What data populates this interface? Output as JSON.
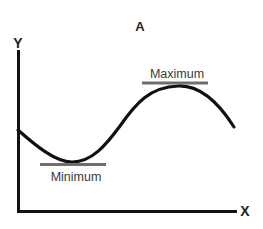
{
  "diagram": {
    "title": "A",
    "axes": {
      "y_label": "Y",
      "x_label": "X"
    },
    "annotations": {
      "maximum_label": "Maximum",
      "minimum_label": "Minimum"
    },
    "colors": {
      "curve": "#111111",
      "axes": "#111111",
      "tangent_bar": "#6e6e6e",
      "label_text": "#3a3a3a",
      "background": "#ffffff"
    }
  }
}
